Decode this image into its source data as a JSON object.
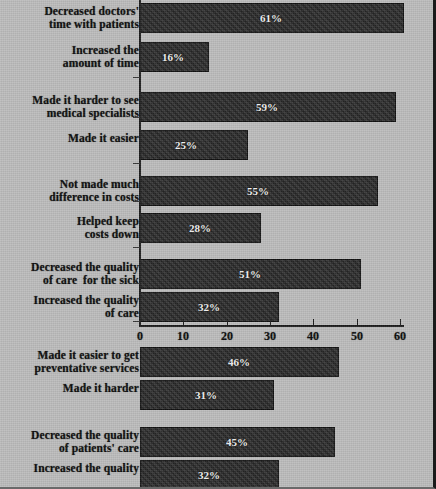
{
  "chart_data": {
    "type": "bar",
    "orientation": "horizontal",
    "title": "",
    "xlabel": "",
    "ylabel": "",
    "xlim": [
      0,
      60
    ],
    "xticks": [
      0,
      10,
      20,
      30,
      40,
      50,
      60
    ],
    "xtick_labels": [
      "0",
      "10",
      "20",
      "30",
      "40",
      "50",
      "60"
    ],
    "grid": false,
    "legend": null,
    "value_suffix": "%",
    "bar_color": "#2a2a2a",
    "background_color": "#bcbcbc",
    "axis_color": "#1c1c1c",
    "categories": [
      "Decreased doctors'\ntime with patients",
      "Increased the\namount of time",
      "Made it harder to see\nmedical specialists",
      "Made it easier",
      "Not made much\ndifference in costs",
      "Helped keep\ncosts down",
      "Decreased the quality\nof care  for the sick",
      "Increased the quality\nof care",
      "Made it easier to get\npreventative services",
      "Made it harder",
      "Decreased the quality\nof patients' care",
      "Increased the quality"
    ],
    "values": [
      61,
      16,
      59,
      25,
      55,
      28,
      51,
      32,
      46,
      31,
      45,
      32
    ],
    "value_labels": [
      "61%",
      "16%",
      "59%",
      "25%",
      "55%",
      "28%",
      "51%",
      "32%",
      "46%",
      "31%",
      "45%",
      "32%"
    ],
    "groups": [
      {
        "name": "doctor-time",
        "category_indices": [
          0,
          1
        ]
      },
      {
        "name": "specialist-access",
        "category_indices": [
          2,
          3
        ]
      },
      {
        "name": "costs",
        "category_indices": [
          4,
          5
        ]
      },
      {
        "name": "quality-of-care-sick",
        "category_indices": [
          6,
          7
        ]
      },
      {
        "name": "preventative-services",
        "category_indices": [
          8,
          9
        ]
      },
      {
        "name": "patients-care-quality",
        "category_indices": [
          10,
          11
        ]
      }
    ]
  }
}
